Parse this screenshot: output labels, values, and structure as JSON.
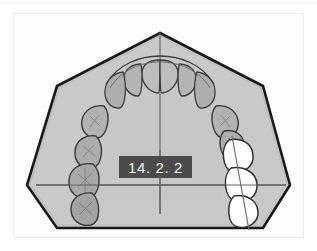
{
  "figure": {
    "label": "14. 2. 2",
    "caption_badge_color": "#4b4b4b",
    "caption_text_color": "#f4f4f4",
    "panel_background": "#fdfdfd",
    "page_background": "#ffffff"
  },
  "diagram": {
    "title": "14. 2. 2",
    "type": "dental-arch-occlusal-view",
    "arch_fill": "#c9c9c9",
    "arch_stroke": "#1a1a1a",
    "reference_line_color": "#6f6f6f",
    "tooth_gray_fill": "#b9b9b9",
    "tooth_white_fill": "#ffffff",
    "tooth_stroke": "#3a3a3a",
    "vertical_midline_label": "midline",
    "horizontal_reference_label": "transverse-reference-line",
    "highlighted_side": "right",
    "highlighted_tooth_count": 3,
    "gray_tooth_count": 13,
    "background_polygon_points": "160,33 263,86 290,185 263,228 57,228 27,185 57,86"
  },
  "teeth": {
    "gray": [
      {
        "id": "t1",
        "cx": 160,
        "cy": 68,
        "rx": 18,
        "ry": 13,
        "rot": 0,
        "shape": "incisor-pair"
      },
      {
        "id": "t2",
        "cx": 137,
        "cy": 78,
        "rx": 11,
        "ry": 15,
        "rot": -12,
        "shape": "incisor"
      },
      {
        "id": "t3",
        "cx": 184,
        "cy": 78,
        "rx": 11,
        "ry": 15,
        "rot": 12,
        "shape": "incisor"
      },
      {
        "id": "t4",
        "cx": 117,
        "cy": 88,
        "rx": 10,
        "ry": 14,
        "rot": -28,
        "shape": "lateral"
      },
      {
        "id": "t5",
        "cx": 204,
        "cy": 88,
        "rx": 10,
        "ry": 14,
        "rot": 28,
        "shape": "lateral"
      },
      {
        "id": "t6",
        "cx": 101,
        "cy": 104,
        "rx": 11,
        "ry": 13,
        "rot": -42,
        "shape": "canine"
      },
      {
        "id": "t7",
        "cx": 219,
        "cy": 104,
        "rx": 11,
        "ry": 13,
        "rot": 42,
        "shape": "canine"
      },
      {
        "id": "t8",
        "cx": 91,
        "cy": 124,
        "rx": 12,
        "ry": 12,
        "rot": -60,
        "shape": "premolar"
      },
      {
        "id": "t9",
        "cx": 229,
        "cy": 124,
        "rx": 12,
        "ry": 12,
        "rot": 60,
        "shape": "premolar"
      },
      {
        "id": "t10",
        "cx": 85,
        "cy": 147,
        "rx": 14,
        "ry": 13,
        "rot": -75,
        "shape": "molar"
      },
      {
        "id": "t11",
        "cx": 80,
        "cy": 172,
        "rx": 14,
        "ry": 13,
        "rot": -85,
        "shape": "molar"
      },
      {
        "id": "t12",
        "cx": 79,
        "cy": 196,
        "rx": 13,
        "ry": 12,
        "rot": -90,
        "shape": "molar"
      },
      {
        "id": "t13",
        "cx": 152,
        "cy": 62,
        "rx": 9,
        "ry": 8,
        "rot": 0,
        "shape": "incisor-edge"
      }
    ],
    "white": [
      {
        "id": "w1",
        "cx": 236,
        "cy": 147,
        "rx": 16,
        "ry": 15,
        "rot": 76,
        "shape": "molar-highlighted"
      },
      {
        "id": "w2",
        "cx": 240,
        "cy": 173,
        "rx": 17,
        "ry": 15,
        "rot": 85,
        "shape": "molar-highlighted"
      },
      {
        "id": "w3",
        "cx": 243,
        "cy": 199,
        "rx": 16,
        "ry": 14,
        "rot": 90,
        "shape": "molar-highlighted"
      }
    ]
  }
}
